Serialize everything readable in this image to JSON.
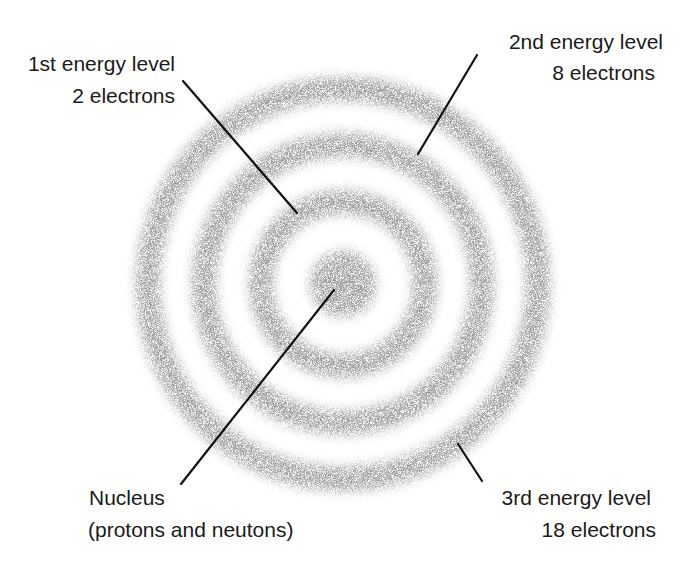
{
  "diagram": {
    "type": "atom-energy-levels",
    "colors": {
      "background": "#ffffff",
      "cloud": "#8c8c8c",
      "leader_line": "#111111",
      "text": "#1a1a1a"
    },
    "nucleus": {
      "label_line1": "Nucleus",
      "label_line2": "(protons and neutons)"
    },
    "energy_levels": [
      {
        "name": "1st energy level",
        "electrons_label": "2 electrons",
        "electrons": 2
      },
      {
        "name": "2nd energy level",
        "electrons_label": "8 electrons",
        "electrons": 8
      },
      {
        "name": "3rd energy level",
        "electrons_label": "18 electrons",
        "electrons": 18
      }
    ]
  }
}
